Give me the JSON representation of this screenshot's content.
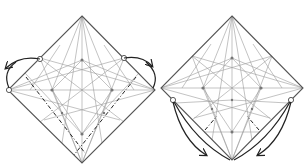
{
  "diagram": {
    "type": "origami-crease-pattern",
    "steps": [
      {
        "id": "step-left",
        "description": "Square sheet in diamond orientation with crease pattern; side corners lifted and folded outward along valley folds",
        "square": {
          "top": [
            82,
            16
          ],
          "left": [
            8,
            90
          ],
          "right": [
            155,
            90
          ],
          "bottom": [
            82,
            163
          ]
        },
        "fold_arrows": [
          "left-corner-swing-up-left",
          "right-corner-swing-up-right"
        ],
        "valley_folds": [
          "left-diagonal-to-bottom",
          "right-diagonal-to-bottom"
        ]
      },
      {
        "id": "step-right",
        "description": "Same crease pattern; lower side points folded down toward bottom corner with small valley folds",
        "square": {
          "top": [
            232,
            16
          ],
          "left": [
            161,
            88
          ],
          "right": [
            303,
            88
          ],
          "bottom": [
            232,
            160
          ]
        },
        "fold_arrows": [
          "left-lower-point-to-bottom",
          "right-lower-point-to-bottom"
        ],
        "valley_folds": [
          "left-small-valley",
          "right-small-valley"
        ]
      }
    ],
    "colors": {
      "edge": "#555555",
      "crease": "#9a9a9a",
      "fold_line": "#222222",
      "arrow": "#222222"
    }
  }
}
